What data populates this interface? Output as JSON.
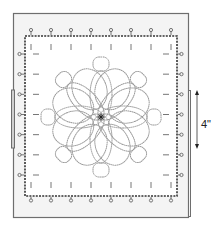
{
  "diagram": {
    "dimension_label": "4\"",
    "top_pin_count": 8,
    "bottom_pin_count": 8,
    "left_pin_count": 7,
    "right_pin_count": 7,
    "petal_count": 8,
    "colors": {
      "outer_frame": "#6e6e6e",
      "outer_fill": "#f4f4f4",
      "inner_fill": "#ffffff",
      "dashed_edge": "#333333",
      "pins": "#555555",
      "motif": "#9a9a9a",
      "tick_marks": "#666666"
    }
  }
}
